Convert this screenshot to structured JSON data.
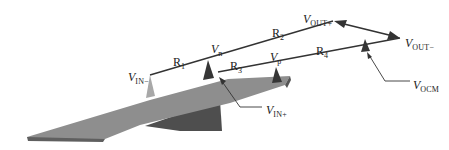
{
  "diagram": {
    "title": "",
    "colors": {
      "background": "#ffffff",
      "line": "#333333",
      "plate_top": "#8c8c8c",
      "plate_side": "#5e5e5e",
      "plate_edge": "#6a6a6a",
      "spike_dark": "#3a3a3a",
      "spike_light": "#a9a9a9"
    },
    "labels": {
      "v_in_minus": {
        "main": "V",
        "sub": "IN−"
      },
      "v_n": {
        "main": "V",
        "sub": "n"
      },
      "v_out_plus": {
        "main": "V",
        "sub": "OUT+"
      },
      "v_out_minus": {
        "main": "V",
        "sub": "OUT−"
      },
      "v_p": {
        "main": "V",
        "sub": "p"
      },
      "v_in_plus": {
        "main": "V",
        "sub": "IN+"
      },
      "v_ocm": {
        "main": "V",
        "sub": "OCM"
      },
      "r1": {
        "main": "R",
        "sub": "1"
      },
      "r2": {
        "main": "R",
        "sub": "2"
      },
      "r3": {
        "main": "R",
        "sub": "3"
      },
      "r4": {
        "main": "R",
        "sub": "4"
      }
    }
  }
}
